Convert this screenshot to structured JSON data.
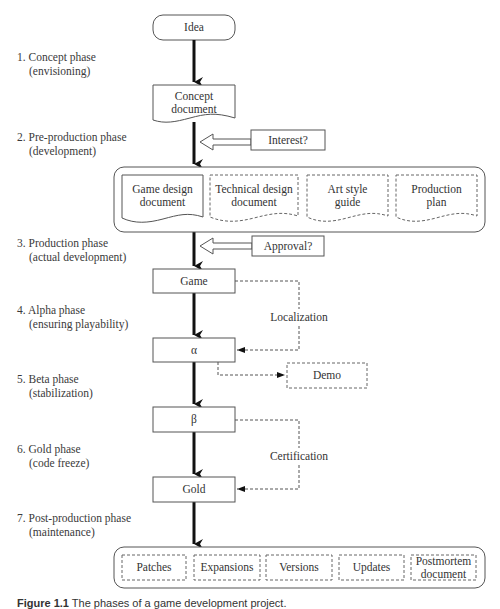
{
  "diagram": {
    "title": "Phases of a game development project",
    "start_node": "Idea",
    "phases": [
      {
        "number": "1.",
        "name": "Concept phase",
        "detail": "(envisioning)"
      },
      {
        "number": "2.",
        "name": "Pre-production phase",
        "detail": "(development)"
      },
      {
        "number": "3.",
        "name": "Production phase",
        "detail": "(actual development)"
      },
      {
        "number": "4.",
        "name": "Alpha phase",
        "detail": "(ensuring playability)"
      },
      {
        "number": "5.",
        "name": "Beta phase",
        "detail": "(stabilization)"
      },
      {
        "number": "6.",
        "name": "Gold phase",
        "detail": "(code freeze)"
      },
      {
        "number": "7.",
        "name": "Post-production phase",
        "detail": "(maintenance)"
      }
    ],
    "concept_document": {
      "line1": "Concept",
      "line2": "document"
    },
    "gates": {
      "interest": "Interest?",
      "approval": "Approval?"
    },
    "preproduction_docs": [
      {
        "line1": "Game design",
        "line2": "document",
        "style": "solid"
      },
      {
        "line1": "Technical design",
        "line2": "document",
        "style": "dashed"
      },
      {
        "line1": "Art style",
        "line2": "guide",
        "style": "dashed"
      },
      {
        "line1": "Production",
        "line2": "plan",
        "style": "dashed"
      }
    ],
    "milestones": {
      "game": "Game",
      "alpha": "α",
      "beta": "β",
      "gold": "Gold"
    },
    "side_flows": {
      "localization": "Localization",
      "demo": "Demo",
      "certification": "Certification"
    },
    "postproduction_items": [
      {
        "line1": "Patches",
        "line2": ""
      },
      {
        "line1": "Expansions",
        "line2": ""
      },
      {
        "line1": "Versions",
        "line2": ""
      },
      {
        "line1": "Updates",
        "line2": ""
      },
      {
        "line1": "Postmortem",
        "line2": "document"
      }
    ]
  },
  "caption": {
    "label": "Figure 1.1",
    "text": "The phases of a game development project."
  }
}
